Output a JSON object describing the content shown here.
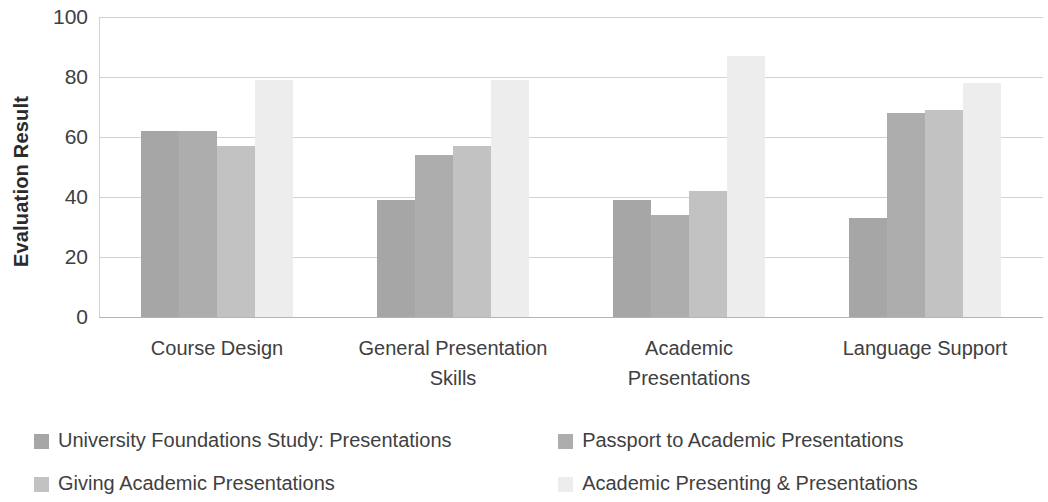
{
  "chart_data": {
    "type": "bar",
    "title": "",
    "subtitle": "",
    "xlabel": "",
    "ylabel": "Evaluation Result",
    "ylim": [
      0,
      100
    ],
    "yticks": [
      100,
      80,
      60,
      40,
      20,
      0
    ],
    "grid": true,
    "legend_position": "bottom",
    "categories": [
      "Course Design",
      "General Presentation Skills",
      "Academic Presentations",
      "Language Support"
    ],
    "series": [
      {
        "name": "University Foundations Study: Presentations",
        "color": "#a6a6a6",
        "values": [
          62,
          39,
          39,
          33
        ]
      },
      {
        "name": "Passport to Academic Presentations",
        "color": "#adadad",
        "values": [
          62,
          54,
          34,
          68
        ]
      },
      {
        "name": "Giving Academic Presentations",
        "color": "#c2c2c2",
        "values": [
          57,
          57,
          42,
          69
        ]
      },
      {
        "name": "Academic Presenting & Presentations",
        "color": "#ededed",
        "values": [
          79,
          79,
          87,
          78
        ]
      }
    ]
  },
  "axis": {
    "y_title": "Evaluation Result",
    "tick_labels": [
      "100",
      "80",
      "60",
      "40",
      "20",
      "0"
    ]
  },
  "categories_display": [
    {
      "line1": "Course Design",
      "line2": ""
    },
    {
      "line1": "General Presentation",
      "line2": "Skills"
    },
    {
      "line1": "Academic",
      "line2": "Presentations"
    },
    {
      "line1": "Language Support",
      "line2": ""
    }
  ],
  "legend": {
    "row1": {
      "left": "University Foundations Study: Presentations",
      "right": "Passport to Academic Presentations"
    },
    "row2": {
      "left": "Giving Academic Presentations",
      "right": "Academic Presenting & Presentations"
    }
  }
}
